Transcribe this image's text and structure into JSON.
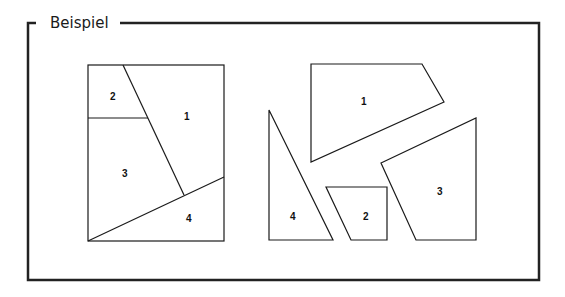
{
  "title": "Beispiel",
  "colors": {
    "stroke": "#1a1a1a",
    "frame": "#222222",
    "background": "#ffffff"
  },
  "left_figure": {
    "description": "rectangle divided into 4 pieces",
    "pieces": [
      {
        "label": "1"
      },
      {
        "label": "2"
      },
      {
        "label": "3"
      },
      {
        "label": "4"
      }
    ]
  },
  "right_figure": {
    "description": "the 4 pieces separated",
    "pieces": [
      {
        "label": "1"
      },
      {
        "label": "2"
      },
      {
        "label": "3"
      },
      {
        "label": "4"
      }
    ]
  }
}
